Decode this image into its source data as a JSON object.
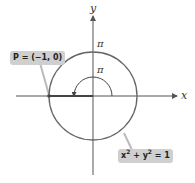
{
  "figure": {
    "type": "unit-circle-angle-diagram",
    "axes": {
      "x_label": "x",
      "y_label": "y"
    },
    "circle": {
      "equation_text": "x² + y² = 1",
      "equation_parts": {
        "x": "x",
        "y": "y",
        "exp": "2",
        "rhs": "= 1"
      },
      "radius": 1,
      "center": [
        0,
        0
      ]
    },
    "labels": {
      "arc_length_label": "π",
      "angle_label": "π",
      "point_label": "P = (−1, 0)"
    },
    "point": {
      "name": "P",
      "coords": [
        -1,
        0
      ]
    },
    "angle_radians": "π",
    "colors": {
      "axis": "#555555",
      "circle": "#666666",
      "radius_segment": "#444444",
      "callout_bg": "#cfcfcf",
      "leader": "#bbbbbb",
      "text": "#333333"
    }
  }
}
